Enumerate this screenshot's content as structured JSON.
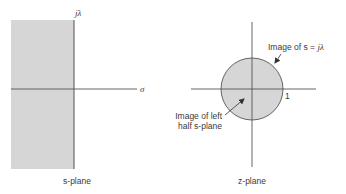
{
  "s_plane": {
    "caption": "s-plane",
    "vertical_axis_label": "jλ",
    "horizontal_axis_label": "σ",
    "shaded_region": "left half s-plane"
  },
  "z_plane": {
    "caption": "z-plane",
    "unit_circle_label": "1",
    "annotation_circle_line1": "Image of s = ",
    "annotation_circle_math": "jλ",
    "annotation_interior_line1": "Image of left",
    "annotation_interior_line2": "half s-plane"
  },
  "colors": {
    "shade": "#d6d6d6",
    "axis": "#555555",
    "text": "#3a3a3a"
  }
}
